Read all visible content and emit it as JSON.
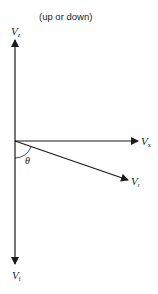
{
  "caption": "(up or down)",
  "labels": {
    "vz": {
      "main": "V",
      "sub": "z"
    },
    "vx": {
      "main": "V",
      "sub": "x"
    },
    "vr": {
      "main": "V",
      "sub": "r"
    },
    "vf": {
      "main": "V",
      "sub": "f"
    },
    "angle": "θ"
  },
  "colors": {
    "line": "#1a1a1a",
    "background": "#ffffff"
  }
}
